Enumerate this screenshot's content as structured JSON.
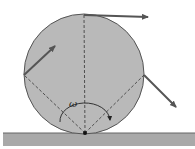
{
  "diagram": {
    "labels": {
      "angular_velocity": "ω"
    },
    "colors": {
      "disk_fill": "#b9b9b9",
      "disk_stroke": "#555555",
      "ground_fill": "#a9a9a9",
      "arrow": "#555555",
      "line": "#333333"
    },
    "elements": [
      {
        "name": "disk",
        "type": "circle"
      },
      {
        "name": "ground",
        "type": "surface"
      },
      {
        "name": "top-velocity-arrow",
        "type": "vector"
      },
      {
        "name": "left-velocity-arrow",
        "type": "vector"
      },
      {
        "name": "right-velocity-arrow",
        "type": "vector"
      },
      {
        "name": "angular-velocity-arc",
        "type": "arc"
      },
      {
        "name": "contact-point",
        "type": "point"
      }
    ]
  }
}
